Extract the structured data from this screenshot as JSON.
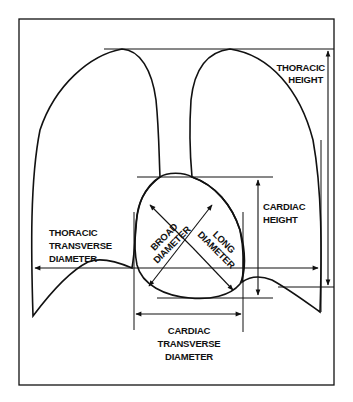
{
  "figure": {
    "labels": {
      "thoracic_height": [
        "THORACIC",
        "HEIGHT"
      ],
      "cardiac_height": [
        "CARDIAC",
        "HEIGHT"
      ],
      "thoracic_transverse_diameter": [
        "THORACIC",
        "TRANSVERSE",
        "DIAMETER"
      ],
      "broad_diameter": [
        "BROAD",
        "DIAMETER"
      ],
      "long_diameter": [
        "LONG",
        "DIAMETER"
      ],
      "cardiac_transverse_diameter": [
        "CARDIAC",
        "TRANSVERSE",
        "DIAMETER"
      ]
    },
    "colors": {
      "line": "#111111",
      "background": "#ffffff"
    }
  }
}
